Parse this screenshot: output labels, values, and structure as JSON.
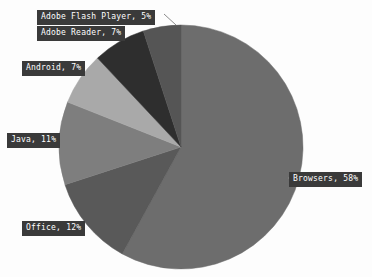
{
  "chart_data": {
    "type": "pie",
    "title": "",
    "categories": [
      "Browsers",
      "Office",
      "Java",
      "Android",
      "Adobe Reader",
      "Adobe Flash Player"
    ],
    "values": [
      58,
      12,
      11,
      7,
      7,
      5
    ],
    "value_unit": "%",
    "legend": "none",
    "label_format": "{category}, {value}%",
    "slices": [
      {
        "label": "Browsers, 58%",
        "category": "Browsers",
        "value": 58,
        "color": "#6d6d6d"
      },
      {
        "label": "Office, 12%",
        "category": "Office",
        "value": 12,
        "color": "#595959"
      },
      {
        "label": "Java, 11%",
        "category": "Java",
        "value": 11,
        "color": "#7e7e7e"
      },
      {
        "label": "Android, 7%",
        "category": "Android",
        "value": 7,
        "color": "#a9a9a9"
      },
      {
        "label": "Adobe Reader, 7%",
        "category": "Adobe Reader",
        "value": 7,
        "color": "#2e2e2e"
      },
      {
        "label": "Adobe Flash Player, 5%",
        "category": "Adobe Flash Player",
        "value": 5,
        "color": "#555555"
      }
    ]
  },
  "labels": {
    "flash": "Adobe Flash Player, 5%",
    "reader": "Adobe Reader, 7%",
    "android": "Android, 7%",
    "java": "Java, 11%",
    "office": "Office, 12%",
    "browsers": "Browsers, 58%"
  },
  "colors": {
    "background": "#fdfdfd",
    "label_background": "#3a3a3a",
    "label_text": "#ffffff",
    "leader_line": "#8a8a8a"
  }
}
